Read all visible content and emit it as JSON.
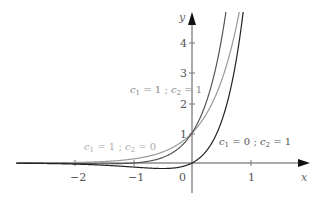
{
  "chart_data": {
    "type": "line",
    "title": "",
    "xlabel": "x",
    "ylabel": "y",
    "xlim": [
      -3,
      1.3
    ],
    "ylim": [
      -0.6,
      4.8
    ],
    "grid": false,
    "legend": "inline annotations",
    "x_ticks": [
      "-2",
      "-1",
      "0",
      "1"
    ],
    "y_ticks": [
      "1",
      "2",
      "3",
      "4"
    ],
    "series": [
      {
        "name": "c1 = 1 ; c2 = 1",
        "formula": "(1 + x) e^{2x}",
        "color": "#555555",
        "x": [
          -3,
          -2,
          -1,
          -0.5,
          0,
          0.25,
          0.5,
          0.6
        ],
        "values": [
          -0.005,
          -0.018,
          0,
          0.18,
          1,
          2.06,
          4.08,
          5.3
        ]
      },
      {
        "name": "c1 = 1 ; c2 = 0",
        "formula": "e^{2x}",
        "color": "#999999",
        "x": [
          -3,
          -2,
          -1,
          -0.5,
          0,
          0.25,
          0.5,
          0.75
        ],
        "values": [
          0.002,
          0.018,
          0.135,
          0.37,
          1,
          1.65,
          2.72,
          4.48
        ]
      },
      {
        "name": "c1 = 0 ; c2 = 1",
        "formula": "x e^{2x}",
        "color": "#222222",
        "x": [
          -3,
          -2,
          -1,
          -0.5,
          0,
          0.25,
          0.5,
          0.75,
          0.85
        ],
        "values": [
          -0.007,
          -0.037,
          -0.135,
          -0.184,
          0,
          0.41,
          1.36,
          3.36,
          4.65
        ]
      }
    ],
    "annotations": [
      {
        "text": "c1 = 1 ; c2 = 1",
        "near": [
          -0.5,
          2.6
        ]
      },
      {
        "text": "c1 = 1 ; c2 = 0",
        "near": [
          -1.8,
          0.8
        ]
      },
      {
        "text": "c1 = 0 ; c2 = 1",
        "near": [
          0.5,
          0.8
        ]
      }
    ]
  },
  "labels": {
    "x_axis": "x",
    "y_axis": "y",
    "ticks_x": [
      "−2",
      "−1",
      "0",
      "1"
    ],
    "ticks_y": [
      "1",
      "2",
      "3",
      "4"
    ],
    "ann1_c1": "1",
    "ann1_c2": "1",
    "ann2_c1": "1",
    "ann2_c2": "0",
    "ann3_c1": "0",
    "ann3_c2": "1"
  }
}
